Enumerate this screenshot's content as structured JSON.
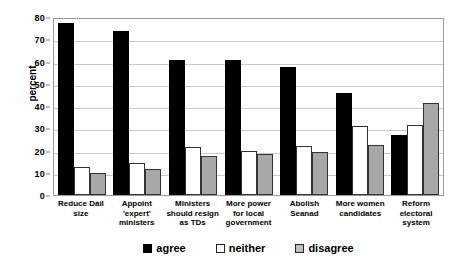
{
  "chart_data": {
    "type": "bar",
    "title": "",
    "xlabel": "",
    "ylabel": "percent",
    "ylim": [
      0,
      80
    ],
    "yticks": [
      0,
      10,
      20,
      30,
      40,
      50,
      60,
      70,
      80
    ],
    "grid": true,
    "legend_position": "bottom",
    "categories": [
      "Reduce Dáil size",
      "Appoint 'expert' ministers",
      "Ministers should resign as TDs",
      "More power for local government",
      "Abolish Seanad",
      "More women candidates",
      "Reform electoral system"
    ],
    "category_lines": [
      [
        "Reduce Dáil",
        "size"
      ],
      [
        "Appoint 'expert'",
        "ministers"
      ],
      [
        "Ministers",
        "should resign",
        "as TDs"
      ],
      [
        "More power",
        "for local",
        "government"
      ],
      [
        "Abolish Seanad"
      ],
      [
        "More women",
        "candidates"
      ],
      [
        "Reform",
        "electoral",
        "system"
      ]
    ],
    "series": [
      {
        "name": "agree",
        "color": "#000000",
        "values": [
          77.5,
          73.5,
          60.5,
          60.5,
          57.5,
          46.0,
          27.0
        ]
      },
      {
        "name": "neither",
        "color": "#ffffff",
        "values": [
          12.5,
          14.5,
          21.5,
          20.0,
          22.0,
          31.0,
          31.5
        ]
      },
      {
        "name": "disagree",
        "color": "#a8a8a8",
        "values": [
          9.8,
          11.5,
          17.5,
          18.5,
          19.5,
          22.5,
          41.5
        ]
      }
    ]
  },
  "legend": {
    "items": [
      {
        "label": "agree"
      },
      {
        "label": "neither"
      },
      {
        "label": "disagree"
      }
    ]
  }
}
